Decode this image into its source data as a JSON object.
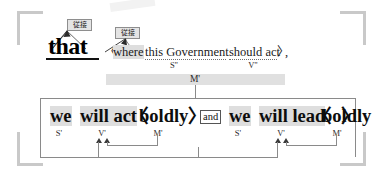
{
  "diagram": {
    "headword": {
      "text": "that",
      "tag": "従接"
    },
    "subordinate_clause": {
      "open_bracket": "〈",
      "relative_word": "where",
      "relative_tag": "従接",
      "subject": "this Government",
      "verb": "should act",
      "close_bracket": "〉",
      "punctuation": ",",
      "subject_label": "S\"",
      "verb_label": "V\"",
      "modifier_label": "M'"
    },
    "main_clause": {
      "conjunction": "and",
      "left": {
        "subject": "we",
        "verb": "will act",
        "modifier_open": "〈",
        "modifier": "boldly",
        "modifier_close": "〉",
        "subject_label": "S'",
        "verb_label": "V'",
        "modifier_label": "M'"
      },
      "right": {
        "subject": "we",
        "verb": "will lead",
        "modifier_open": "〈",
        "modifier": "boldly",
        "modifier_close": "〉",
        "subject_label": "S'",
        "verb_label": "V'",
        "modifier_label": "M'"
      }
    },
    "colors": {
      "highlight": "#dedede",
      "band": "#e0e0e0",
      "bracket": "#c9c9c9",
      "connector": "#8a8a8a",
      "tag_fill": "#e4e4e4",
      "tag_border": "#8e8e8e",
      "text": "#0d0d0d"
    }
  }
}
